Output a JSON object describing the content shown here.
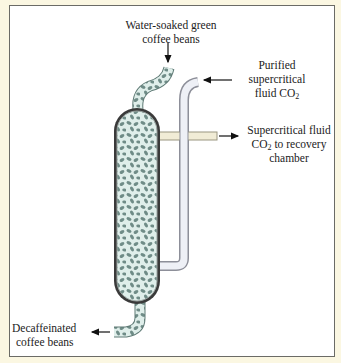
{
  "diagram": {
    "labels": {
      "input_beans": {
        "line1": "Water-soaked green",
        "line2": "coffee beans"
      },
      "co2_in": {
        "line1": "Purified",
        "line2": "supercritical",
        "line3_prefix": "fluid CO",
        "line3_sub": "2"
      },
      "co2_out": {
        "line1": "Supercritical fluid",
        "line2_prefix": "CO",
        "line2_sub": "2",
        "line2_suffix": " to recovery",
        "line3": "chamber"
      },
      "output_beans": {
        "line1": "Decaffeinated",
        "line2": "coffee beans"
      }
    },
    "colors": {
      "background": "#fbf7e2",
      "panel": "#ffffff",
      "border": "#6b6b66",
      "column_wall": "#3a3a3a",
      "bean_fill": "#dfeeea",
      "bean": "#6f8c87",
      "co2_pipe": "#eef0f6",
      "co2_pipe_edge": "#8d8f99",
      "outlet_pipe": "#f1ecd6",
      "arrow": "#111111"
    }
  }
}
